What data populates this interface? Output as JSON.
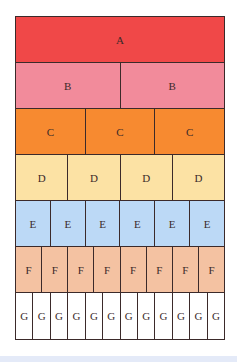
{
  "diagram": {
    "rows": [
      {
        "label": "A",
        "count": 1,
        "color": "#f04848"
      },
      {
        "label": "B",
        "count": 2,
        "color": "#f28b9b"
      },
      {
        "label": "C",
        "count": 3,
        "color": "#f78a30"
      },
      {
        "label": "D",
        "count": 4,
        "color": "#fce2a4"
      },
      {
        "label": "E",
        "count": 6,
        "color": "#bcd9f6"
      },
      {
        "label": "F",
        "count": 8,
        "color": "#f4c2a2"
      },
      {
        "label": "G",
        "count": 12,
        "color": "#ffffff"
      }
    ]
  }
}
